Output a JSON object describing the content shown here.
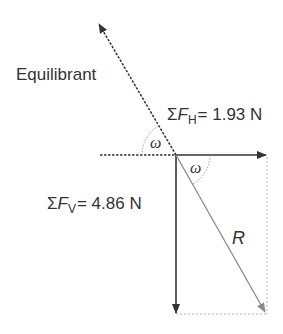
{
  "diagram": {
    "labels": {
      "equilibrant": "Equilibrant",
      "sum_symbol": "Σ",
      "force_symbol": "F",
      "horizontal_sub": "H",
      "horizontal_value": "= 1.93 N",
      "vertical_sub": "V",
      "vertical_value": "= 4.86 N",
      "resultant": "R",
      "angle_upper": "ω",
      "angle_lower": "ω"
    },
    "vectors": [
      {
        "name": "equilibrant",
        "from": [
          176,
          155
        ],
        "to": [
          98,
          22
        ],
        "style": "dashed"
      },
      {
        "name": "sum-fh",
        "from": [
          176,
          155
        ],
        "to": [
          266,
          155
        ],
        "style": "solid",
        "value": "1.93 N"
      },
      {
        "name": "sum-fv",
        "from": [
          176,
          155
        ],
        "to": [
          176,
          313
        ],
        "style": "solid",
        "value": "4.86 N"
      },
      {
        "name": "resultant",
        "from": [
          176,
          155
        ],
        "to": [
          266,
          313
        ],
        "style": "solid-gray"
      }
    ],
    "colors": {
      "ink": "#333333",
      "resultant": "#8a8a8a",
      "guide": "#b5b5b5"
    }
  }
}
